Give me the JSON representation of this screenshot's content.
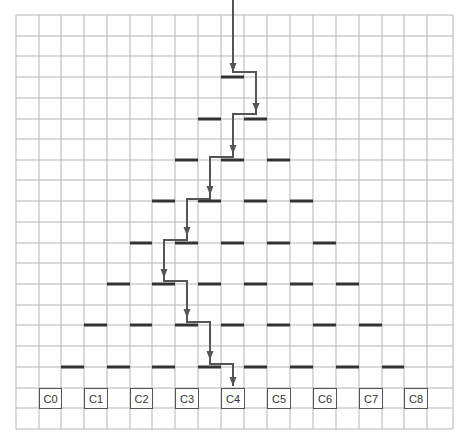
{
  "diagram": {
    "type": "galton-board",
    "grid": {
      "x_lines": [
        16,
        39,
        61,
        84,
        107,
        130,
        152,
        175,
        198,
        221,
        244,
        267,
        290,
        313,
        336,
        359,
        382,
        404,
        427,
        453
      ],
      "y_lines": [
        15,
        36,
        56,
        77,
        98,
        119,
        139,
        160,
        180,
        201,
        222,
        243,
        263,
        284,
        305,
        325,
        346,
        367,
        388,
        408,
        429
      ],
      "color": "#b5b5b5"
    },
    "pegs": [
      {
        "row_y": 77,
        "cols": [
          9
        ]
      },
      {
        "row_y": 119,
        "cols": [
          8,
          10
        ]
      },
      {
        "row_y": 160,
        "cols": [
          7,
          9,
          11
        ]
      },
      {
        "row_y": 201,
        "cols": [
          6,
          8,
          10,
          12
        ]
      },
      {
        "row_y": 243,
        "cols": [
          5,
          7,
          9,
          11,
          13
        ]
      },
      {
        "row_y": 284,
        "cols": [
          4,
          6,
          8,
          10,
          12,
          14
        ]
      },
      {
        "row_y": 325,
        "cols": [
          3,
          5,
          7,
          9,
          11,
          13,
          15
        ]
      },
      {
        "row_y": 367,
        "cols": [
          2,
          4,
          6,
          8,
          10,
          12,
          14,
          16
        ]
      }
    ],
    "peg_color": "#333333",
    "path_color": "#555555",
    "path_points": [
      [
        233,
        0
      ],
      [
        233,
        72
      ],
      [
        238,
        72
      ],
      [
        256,
        72
      ],
      [
        256,
        112
      ],
      [
        256,
        114
      ],
      [
        233,
        114
      ],
      [
        233,
        154
      ],
      [
        233,
        157
      ],
      [
        210,
        157
      ],
      [
        210,
        195
      ],
      [
        210,
        199
      ],
      [
        187,
        199
      ],
      [
        187,
        236
      ],
      [
        187,
        240
      ],
      [
        164,
        240
      ],
      [
        164,
        278
      ],
      [
        164,
        281
      ],
      [
        187,
        281
      ],
      [
        187,
        318
      ],
      [
        187,
        322
      ],
      [
        210,
        322
      ],
      [
        210,
        360
      ],
      [
        210,
        364
      ],
      [
        233,
        364
      ],
      [
        233,
        386
      ]
    ],
    "arrow_tips": [
      [
        233,
        72
      ],
      [
        256,
        112
      ],
      [
        233,
        154
      ],
      [
        210,
        195
      ],
      [
        187,
        236
      ],
      [
        164,
        278
      ],
      [
        187,
        318
      ],
      [
        210,
        360
      ],
      [
        233,
        386
      ]
    ],
    "bins": [
      {
        "label": "C0",
        "col": 1
      },
      {
        "label": "C1",
        "col": 3
      },
      {
        "label": "C2",
        "col": 5
      },
      {
        "label": "C3",
        "col": 7
      },
      {
        "label": "C4",
        "col": 9
      },
      {
        "label": "C5",
        "col": 11
      },
      {
        "label": "C6",
        "col": 13
      },
      {
        "label": "C7",
        "col": 15
      },
      {
        "label": "C8",
        "col": 17
      }
    ],
    "bin_row_y": 388
  }
}
